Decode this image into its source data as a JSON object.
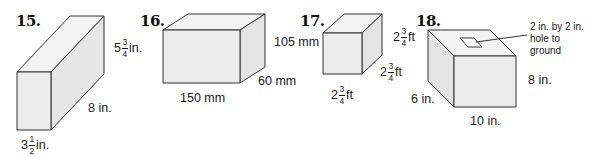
{
  "problems": [
    {
      "number": "15.",
      "shape": "rectangular prism",
      "labels": {
        "height": {
          "whole": "5",
          "num": "3",
          "den": "4",
          "unit": "in."
        },
        "length": "8 in.",
        "width": {
          "whole": "3",
          "num": "1",
          "den": "2",
          "unit": "in."
        }
      }
    },
    {
      "number": "16.",
      "shape": "rectangular prism",
      "labels": {
        "height": "105 mm",
        "depth": "60 mm",
        "length": "150 mm"
      }
    },
    {
      "number": "17.",
      "shape": "cube",
      "labels": {
        "height": {
          "whole": "2",
          "num": "3",
          "den": "4",
          "unit": "ft"
        },
        "depth": {
          "whole": "2",
          "num": "3",
          "den": "4",
          "unit": "ft"
        },
        "length": {
          "whole": "2",
          "num": "3",
          "den": "4",
          "unit": "ft"
        }
      }
    },
    {
      "number": "18.",
      "shape": "rectangular prism with hole",
      "labels": {
        "hole_note_line1": "2 in. by 2 in.",
        "hole_note_line2": "hole to",
        "hole_note_line3": "ground",
        "height": "8 in.",
        "depth": "6 in.",
        "length": "10 in."
      }
    }
  ],
  "colors": {
    "face": "#ececec",
    "top": "#f3f3f3",
    "side": "#e4e4e4",
    "stroke": "#333333"
  }
}
